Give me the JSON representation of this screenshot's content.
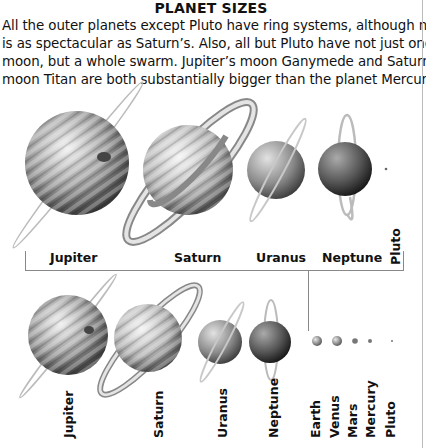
{
  "title": "PLANET SIZES",
  "body_lines": [
    "All the outer planets except Pluto have ring systems, although none",
    "is as spectacular as Saturn’s. Also, all but Pluto have not just one",
    "moon, but a whole swarm. Jupiter’s moon Ganymede and Saturn’s",
    "moon Titan are both substantially bigger than the planet Mercury."
  ],
  "top_row": {
    "labels": [
      "Jupiter",
      "Saturn",
      "Uranus",
      "Neptune",
      "Pluto"
    ]
  },
  "bottom_row": {
    "labels": [
      "Jupiter",
      "Saturn",
      "Uranus",
      "Neptune",
      "Earth",
      "Venus",
      "Mars",
      "Mercury",
      "Pluto"
    ]
  },
  "colors": {
    "line": "#888888",
    "planet_light": "#e6e6e6",
    "planet_dark": "#3a3a3a"
  }
}
